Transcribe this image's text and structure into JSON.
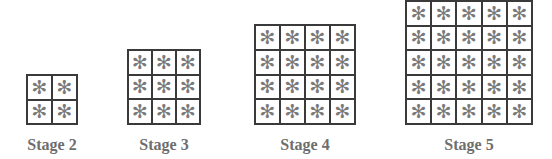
{
  "figure": {
    "type": "pattern-sequence",
    "cell_symbol": "✻",
    "stages": [
      {
        "label": "Stage 2",
        "n": 2
      },
      {
        "label": "Stage 3",
        "n": 3
      },
      {
        "label": "Stage 4",
        "n": 4
      },
      {
        "label": "Stage 5",
        "n": 5
      }
    ]
  }
}
